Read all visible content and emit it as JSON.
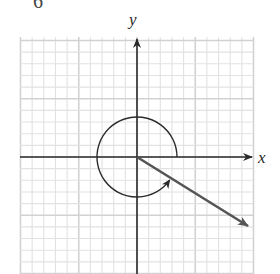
{
  "figure": {
    "top_fragment": "6",
    "x_axis_label": "x",
    "y_axis_label": "y",
    "colors": {
      "grid_minor": "#e2e2e2",
      "grid_major": "#d2d2d2",
      "axis": "#2b2b2b",
      "ray": "#555555",
      "arc": "#2b2b2b"
    },
    "grid": {
      "left": 20,
      "top": 37,
      "right": 253,
      "bottom": 274,
      "cell": 11.65,
      "cells_x": 20,
      "major_every": 5
    },
    "origin": {
      "x": 137,
      "y": 157
    },
    "ray_end": {
      "x": 248,
      "y": 226
    },
    "angle_arc": {
      "radius": 40,
      "start_deg": 0,
      "direction": "counterclockwise",
      "approx_sweep_deg": 328
    }
  }
}
